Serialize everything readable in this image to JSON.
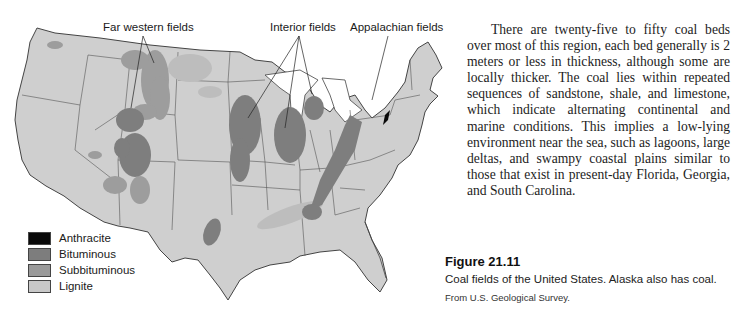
{
  "figure": {
    "number_label": "Figure 21.11",
    "caption": "Coal fields of the United States. Alaska also has coal.",
    "source": "From U.S. Geological Survey."
  },
  "map": {
    "callouts": [
      {
        "label": "Far western fields"
      },
      {
        "label": "Interior fields"
      },
      {
        "label": "Appalachian fields"
      }
    ],
    "base_color": "#cfcfcf",
    "border_color": "#444444"
  },
  "legend": {
    "items": [
      {
        "label": "Anthracite",
        "color": "#0a0a0a"
      },
      {
        "label": "Bituminous",
        "color": "#7d7d7d"
      },
      {
        "label": "Subbituminous",
        "color": "#9a9a9a"
      },
      {
        "label": "Lignite",
        "color": "#c8c8c8"
      }
    ]
  },
  "body": {
    "paragraph": "There are twenty-five to fifty coal beds over most of this region, each bed generally is 2 meters or less in thickness, although some are locally thicker. The coal lies within repeated sequences of sandstone, shale, and limestone, which indicate alternating conti­nental and marine conditions. This implies a low-lying environment near the sea, such as lagoons, large deltas, and swampy coastal plains similar to those that exist in present-day Florida, Georgia, and South Carolina."
  }
}
